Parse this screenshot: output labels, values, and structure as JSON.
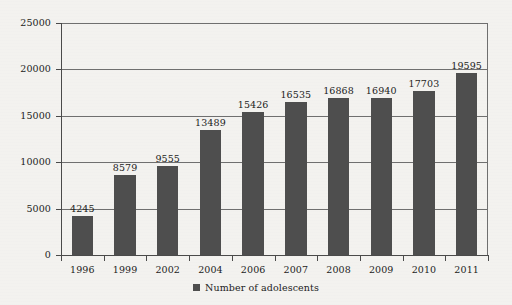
{
  "chart_data": {
    "type": "bar",
    "title": "",
    "subtitle": "",
    "xlabel": "",
    "ylabel": "",
    "categories": [
      "1996",
      "1999",
      "2002",
      "2004",
      "2006",
      "2007",
      "2008",
      "2009",
      "2010",
      "2011"
    ],
    "values": [
      4245,
      8579,
      9555,
      13489,
      15426,
      16535,
      16868,
      16940,
      17703,
      19595
    ],
    "series": [
      {
        "name": "Number of adolescents",
        "values": [
          4245,
          8579,
          9555,
          13489,
          15426,
          16535,
          16868,
          16940,
          17703,
          19595
        ],
        "color": "#4e4e4e"
      }
    ],
    "ylim": [
      0,
      25000
    ],
    "yticks": [
      0,
      5000,
      10000,
      15000,
      20000,
      25000
    ],
    "ytick_labels": [
      "0",
      "5000",
      "10000",
      "15000",
      "20000",
      "25000"
    ],
    "grid": true,
    "grid_axis": "y",
    "data_labels": [
      "4245",
      "8579",
      "9555",
      "13489",
      "15426",
      "16535",
      "16868",
      "16940",
      "17703",
      "19595"
    ],
    "legend": {
      "position": "bottom-center",
      "entries": [
        {
          "label": "Number of adolescents",
          "color": "#4e4e4e",
          "marker": "square"
        }
      ]
    },
    "axis_color": "#4a4a4a",
    "background": "#f3f2ef",
    "text_color": "#1c1c1c"
  }
}
